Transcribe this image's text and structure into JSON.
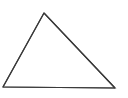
{
  "diagram": {
    "shape": "triangle",
    "stroke_color": "#3a3a3a",
    "fill_color": "#ffffff",
    "background": "#ffffff",
    "vertices": [
      "apex",
      "bottom-left",
      "bottom-right"
    ]
  }
}
